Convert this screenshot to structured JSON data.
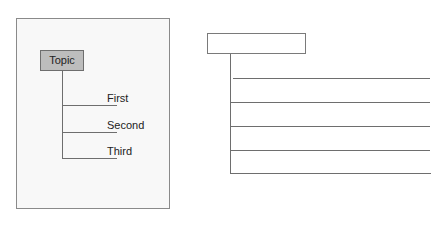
{
  "left_diagram": {
    "root_label": "Topic",
    "branches": [
      {
        "label": "First"
      },
      {
        "label": "Second"
      },
      {
        "label": "Third"
      }
    ]
  },
  "right_diagram": {
    "root_label": "",
    "line_count": 5
  },
  "colors": {
    "topic_fill": "#bdbdbd",
    "line": "#6e6e6e",
    "panel_bg": "#f8f8f8"
  }
}
